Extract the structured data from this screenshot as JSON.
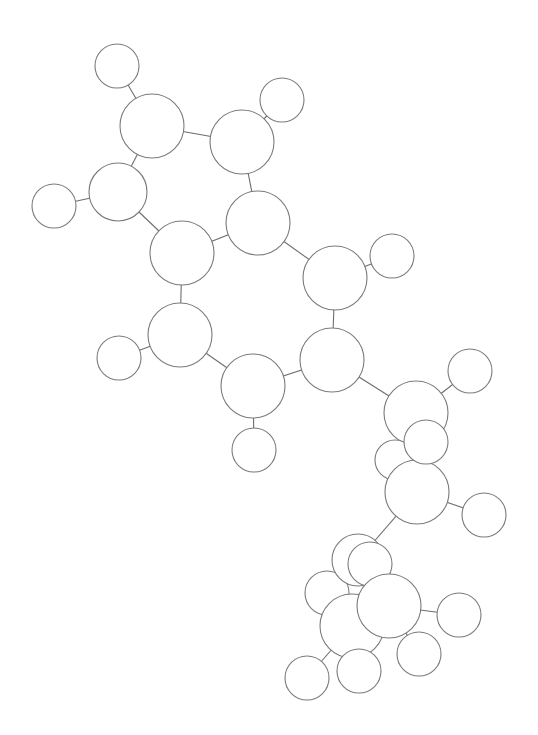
{
  "diagram": {
    "type": "ball-and-stick molecule (unlabeled atoms)",
    "width": 538,
    "height": 735,
    "colors": {
      "background": "#ffffff",
      "atom_fill": "#ffffff",
      "atom_stroke": "#7a7a7a",
      "bond_stroke": "#6e6e6e"
    },
    "atoms": [
      {
        "id": 1,
        "x": 117,
        "y": 66,
        "r": 22
      },
      {
        "id": 2,
        "x": 152,
        "y": 126,
        "r": 32
      },
      {
        "id": 3,
        "x": 282,
        "y": 100,
        "r": 22
      },
      {
        "id": 4,
        "x": 242,
        "y": 142,
        "r": 32
      },
      {
        "id": 5,
        "x": 118,
        "y": 192,
        "r": 29
      },
      {
        "id": 6,
        "x": 54,
        "y": 206,
        "r": 22
      },
      {
        "id": 7,
        "x": 258,
        "y": 223,
        "r": 32
      },
      {
        "id": 8,
        "x": 182,
        "y": 253,
        "r": 32
      },
      {
        "id": 9,
        "x": 335,
        "y": 278,
        "r": 32
      },
      {
        "id": 10,
        "x": 392,
        "y": 256,
        "r": 22
      },
      {
        "id": 11,
        "x": 180,
        "y": 335,
        "r": 32
      },
      {
        "id": 12,
        "x": 119,
        "y": 358,
        "r": 22
      },
      {
        "id": 13,
        "x": 332,
        "y": 360,
        "r": 32
      },
      {
        "id": 14,
        "x": 253,
        "y": 386,
        "r": 32
      },
      {
        "id": 15,
        "x": 254,
        "y": 450,
        "r": 22
      },
      {
        "id": 16,
        "x": 416,
        "y": 413,
        "r": 32
      },
      {
        "id": 17,
        "x": 470,
        "y": 371,
        "r": 22
      },
      {
        "id": 18,
        "x": 395,
        "y": 460,
        "r": 20
      },
      {
        "id": 20,
        "x": 417,
        "y": 492,
        "r": 32
      },
      {
        "id": 19,
        "x": 426,
        "y": 442,
        "r": 22
      },
      {
        "id": 21,
        "x": 484,
        "y": 515,
        "r": 22
      },
      {
        "id": 24,
        "x": 327,
        "y": 593,
        "r": 22
      },
      {
        "id": 22,
        "x": 358,
        "y": 560,
        "r": 26
      },
      {
        "id": 23,
        "x": 370,
        "y": 564,
        "r": 22
      },
      {
        "id": 26,
        "x": 352,
        "y": 626,
        "r": 32
      },
      {
        "id": 25,
        "x": 389,
        "y": 606,
        "r": 32
      },
      {
        "id": 27,
        "x": 459,
        "y": 615,
        "r": 22
      },
      {
        "id": 28,
        "x": 419,
        "y": 654,
        "r": 22
      },
      {
        "id": 29,
        "x": 359,
        "y": 671,
        "r": 22
      },
      {
        "id": 30,
        "x": 307,
        "y": 678,
        "r": 22
      }
    ],
    "bonds": [
      [
        1,
        2
      ],
      [
        2,
        4
      ],
      [
        2,
        5
      ],
      [
        3,
        4
      ],
      [
        4,
        7
      ],
      [
        5,
        6
      ],
      [
        5,
        8
      ],
      [
        7,
        8
      ],
      [
        7,
        9
      ],
      [
        9,
        10
      ],
      [
        8,
        11
      ],
      [
        9,
        13
      ],
      [
        11,
        12
      ],
      [
        11,
        14
      ],
      [
        13,
        14
      ],
      [
        14,
        15
      ],
      [
        13,
        16
      ],
      [
        16,
        17
      ],
      [
        16,
        19
      ],
      [
        19,
        20
      ],
      [
        20,
        21
      ],
      [
        20,
        22
      ],
      [
        22,
        23
      ],
      [
        23,
        25
      ],
      [
        24,
        26
      ],
      [
        25,
        26
      ],
      [
        25,
        27
      ],
      [
        25,
        28
      ],
      [
        26,
        29
      ],
      [
        26,
        30
      ],
      [
        18,
        20
      ]
    ]
  }
}
